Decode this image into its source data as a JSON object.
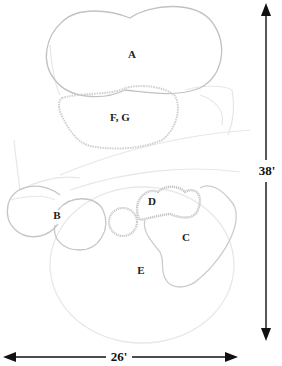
{
  "diagram": {
    "type": "plan-view planting layout",
    "regions": [
      {
        "id": "A",
        "label": "A"
      },
      {
        "id": "FG",
        "label": "F, G"
      },
      {
        "id": "B",
        "label": "B"
      },
      {
        "id": "D",
        "label": "D"
      },
      {
        "id": "C",
        "label": "C"
      },
      {
        "id": "E",
        "label": "E"
      }
    ],
    "dimensions": {
      "height": {
        "label": "38'",
        "orientation": "vertical"
      },
      "width": {
        "label": "26'",
        "orientation": "horizontal"
      }
    },
    "colors": {
      "outline": "#bdbdbd",
      "faint_outline": "#e2e2e2",
      "text": "#222222",
      "arrow": "#111111"
    }
  }
}
